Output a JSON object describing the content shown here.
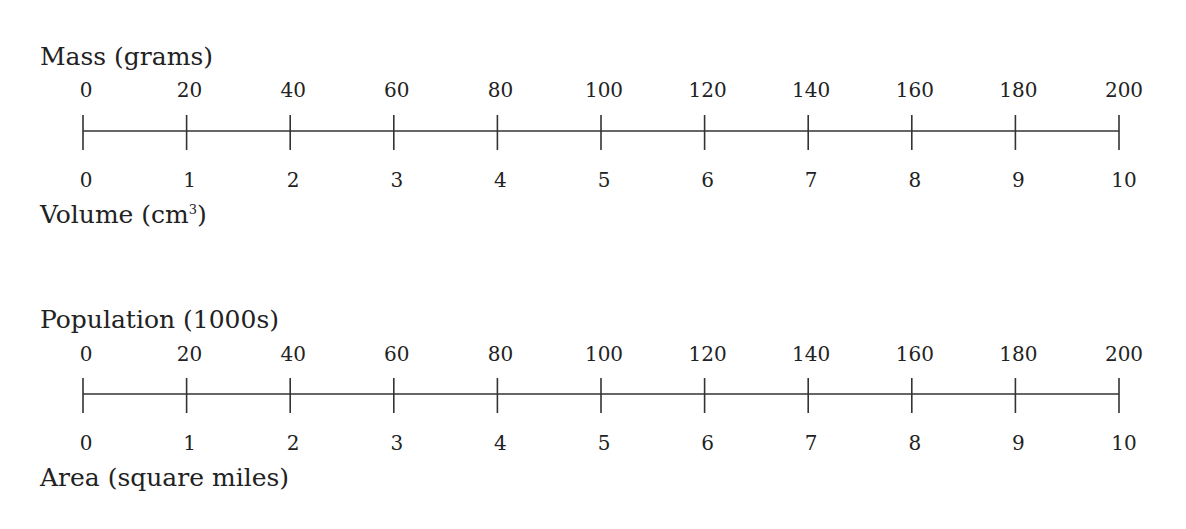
{
  "lines": [
    {
      "top_label": "Mass (grams)",
      "bottom_label": "Volume (cm",
      "bottom_label_sup": "3",
      "bottom_label_end": ")",
      "top_values": [
        "0",
        "20",
        "40",
        "60",
        "80",
        "100",
        "120",
        "140",
        "160",
        "180",
        "200"
      ],
      "bottom_values": [
        "0",
        "1",
        "2",
        "3",
        "4",
        "5",
        "6",
        "7",
        "8",
        "9",
        "10"
      ]
    },
    {
      "top_label": "Population (1000s)",
      "bottom_label": "Area (square miles)",
      "bottom_label_sup": "",
      "bottom_label_end": "",
      "top_values": [
        "0",
        "20",
        "40",
        "60",
        "80",
        "100",
        "120",
        "140",
        "160",
        "180",
        "200"
      ],
      "bottom_values": [
        "0",
        "1",
        "2",
        "3",
        "4",
        "5",
        "6",
        "7",
        "8",
        "9",
        "10"
      ]
    }
  ],
  "chart_data": [
    {
      "type": "double-number-line",
      "top_axis": {
        "label": "Mass (grams)",
        "ticks": [
          0,
          20,
          40,
          60,
          80,
          100,
          120,
          140,
          160,
          180,
          200
        ]
      },
      "bottom_axis": {
        "label": "Volume (cm³)",
        "ticks": [
          0,
          1,
          2,
          3,
          4,
          5,
          6,
          7,
          8,
          9,
          10
        ]
      }
    },
    {
      "type": "double-number-line",
      "top_axis": {
        "label": "Population (1000s)",
        "ticks": [
          0,
          20,
          40,
          60,
          80,
          100,
          120,
          140,
          160,
          180,
          200
        ]
      },
      "bottom_axis": {
        "label": "Area (square miles)",
        "ticks": [
          0,
          1,
          2,
          3,
          4,
          5,
          6,
          7,
          8,
          9,
          10
        ]
      }
    }
  ]
}
